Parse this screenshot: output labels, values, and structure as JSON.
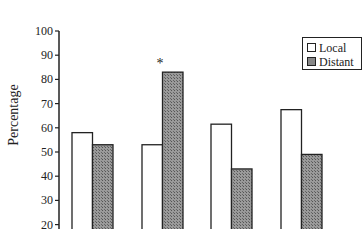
{
  "chart_data": {
    "type": "bar",
    "title": "",
    "xlabel": "",
    "ylabel": "Percentage",
    "ylim": [
      20,
      100
    ],
    "yticks": [
      20,
      30,
      40,
      50,
      60,
      70,
      80,
      90,
      100
    ],
    "categories": [
      "1",
      "2",
      "3",
      "4"
    ],
    "series": [
      {
        "name": "Local",
        "values": [
          58,
          53,
          61.5,
          67.5
        ],
        "fill": "#ffffff"
      },
      {
        "name": "Distant",
        "values": [
          53,
          83,
          43,
          49
        ],
        "fill": "#8a8a8a"
      }
    ],
    "annotations": [
      {
        "text": "*",
        "category_index": 1,
        "series": "Distant"
      }
    ],
    "grid": false,
    "legend_position": "upper right"
  },
  "axis": {
    "ylabel": "Percentage"
  },
  "legend": {
    "local_label": "Local",
    "distant_label": "Distant"
  },
  "annotation": {
    "asterisk": "*"
  }
}
